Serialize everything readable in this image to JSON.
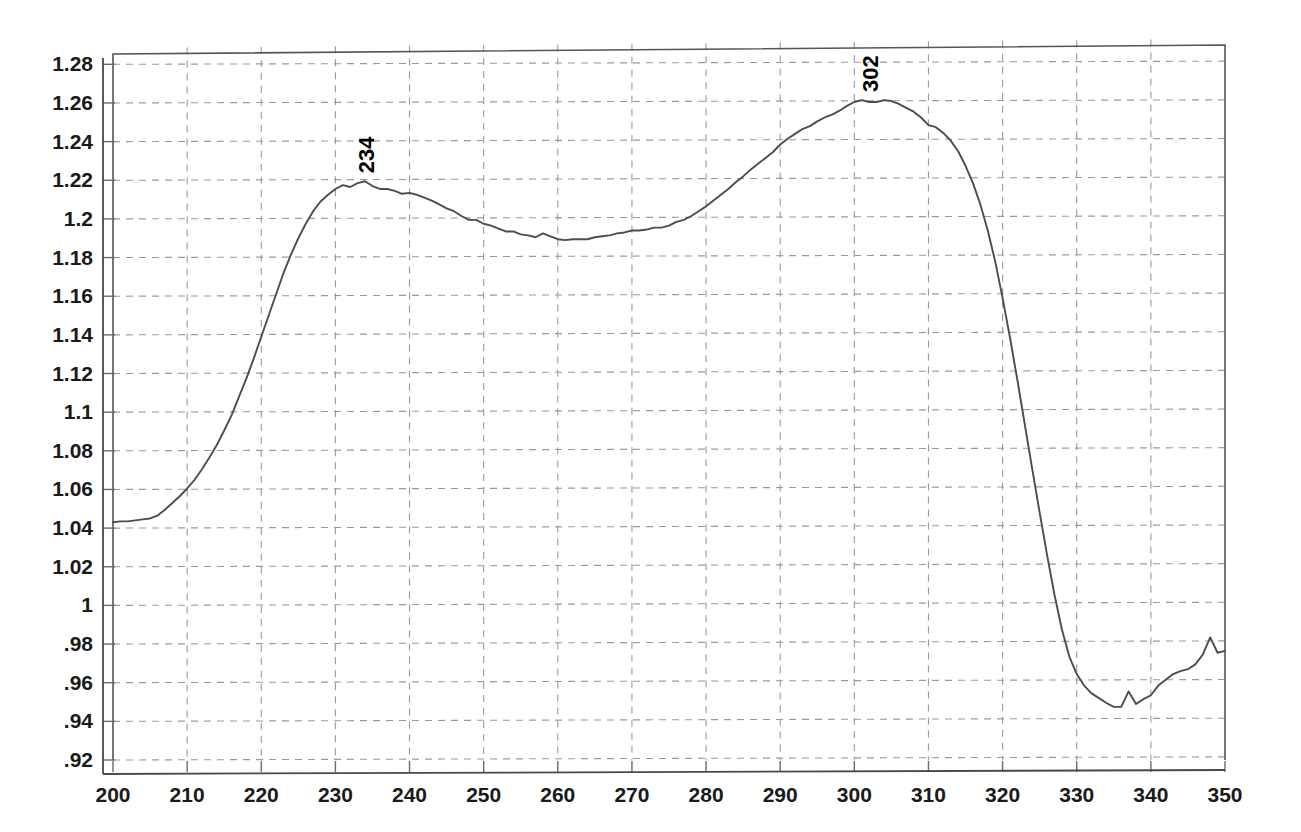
{
  "chart_data": {
    "type": "line",
    "title": "",
    "subtitle": "",
    "xlabel": "",
    "ylabel": "",
    "xlim": [
      200,
      350
    ],
    "ylim": [
      0.92,
      1.29
    ],
    "grid": true,
    "legend": "none",
    "x_ticks": [
      200,
      210,
      220,
      230,
      240,
      250,
      260,
      270,
      280,
      290,
      300,
      310,
      320,
      330,
      340,
      350
    ],
    "x_tick_labels": [
      "200",
      "210",
      "220",
      "230",
      "240",
      "250",
      "260",
      "270",
      "280",
      "290",
      "300",
      "310",
      "320",
      "330",
      "340",
      "350"
    ],
    "y_ticks": [
      0.92,
      0.94,
      0.96,
      0.98,
      1.0,
      1.02,
      1.04,
      1.06,
      1.08,
      1.1,
      1.12,
      1.14,
      1.16,
      1.18,
      1.2,
      1.22,
      1.24,
      1.26,
      1.28
    ],
    "y_tick_labels": [
      ".92",
      ".94",
      ".96",
      ".98",
      "1",
      "1.02",
      "1.04",
      "1.06",
      "1.08",
      "1.1",
      "1.12",
      "1.14",
      "1.16",
      "1.18",
      "1.2",
      "1.22",
      "1.24",
      "1.26",
      "1.28"
    ],
    "annotations": [
      {
        "label": "234",
        "x": 234,
        "y": 1.2195,
        "rotation": -90
      },
      {
        "label": "302",
        "x": 302,
        "y": 1.2615,
        "rotation": -90
      }
    ],
    "series": [
      {
        "name": "spectrum",
        "color": "#4d4d4d",
        "x": [
          200,
          201,
          202,
          203,
          204,
          205,
          206,
          207,
          208,
          209,
          210,
          211,
          212,
          213,
          214,
          215,
          216,
          217,
          218,
          219,
          220,
          221,
          222,
          223,
          224,
          225,
          226,
          227,
          228,
          229,
          230,
          231,
          232,
          233,
          234,
          235,
          236,
          237,
          238,
          239,
          240,
          241,
          242,
          243,
          244,
          245,
          246,
          247,
          248,
          249,
          250,
          251,
          252,
          253,
          254,
          255,
          256,
          257,
          258,
          259,
          260,
          261,
          262,
          263,
          264,
          265,
          266,
          267,
          268,
          269,
          270,
          271,
          272,
          273,
          274,
          275,
          276,
          277,
          278,
          279,
          280,
          281,
          282,
          283,
          284,
          285,
          286,
          287,
          288,
          289,
          290,
          291,
          292,
          293,
          294,
          295,
          296,
          297,
          298,
          299,
          300,
          301,
          302,
          303,
          304,
          305,
          306,
          307,
          308,
          309,
          310,
          311,
          312,
          313,
          314,
          315,
          316,
          317,
          318,
          319,
          320,
          321,
          322,
          323,
          324,
          325,
          326,
          327,
          328,
          329,
          330,
          331,
          332,
          333,
          334,
          335,
          336,
          337,
          338,
          339,
          340,
          341,
          342,
          343,
          344,
          345,
          346,
          347,
          348,
          349,
          350
        ],
        "y": [
          1.043,
          1.0435,
          1.0435,
          1.044,
          1.0445,
          1.045,
          1.0465,
          1.0495,
          1.053,
          1.0565,
          1.0605,
          1.065,
          1.0705,
          1.0765,
          1.083,
          1.0905,
          1.0985,
          1.108,
          1.1175,
          1.128,
          1.139,
          1.15,
          1.161,
          1.172,
          1.1815,
          1.19,
          1.1975,
          1.204,
          1.209,
          1.2125,
          1.2155,
          1.2175,
          1.2165,
          1.2185,
          1.2195,
          1.217,
          1.2155,
          1.2155,
          1.2145,
          1.213,
          1.2135,
          1.2125,
          1.211,
          1.2095,
          1.2075,
          1.2055,
          1.204,
          1.2015,
          1.1995,
          1.1995,
          1.1975,
          1.1965,
          1.195,
          1.1935,
          1.1935,
          1.192,
          1.1915,
          1.1905,
          1.1925,
          1.191,
          1.1895,
          1.189,
          1.1895,
          1.1895,
          1.1895,
          1.1905,
          1.191,
          1.1915,
          1.1925,
          1.193,
          1.194,
          1.194,
          1.1945,
          1.1955,
          1.1955,
          1.1965,
          1.1985,
          1.1995,
          1.2015,
          1.204,
          1.2065,
          1.2095,
          1.2125,
          1.2155,
          1.219,
          1.222,
          1.2255,
          1.2285,
          1.2315,
          1.2345,
          1.2385,
          1.2415,
          1.244,
          1.2465,
          1.248,
          1.2505,
          1.2525,
          1.254,
          1.256,
          1.2585,
          1.2605,
          1.2615,
          1.2605,
          1.2605,
          1.2615,
          1.261,
          1.2595,
          1.2575,
          1.2555,
          1.2525,
          1.2485,
          1.2475,
          1.2445,
          1.2405,
          1.235,
          1.2275,
          1.2185,
          1.2075,
          1.194,
          1.178,
          1.159,
          1.1385,
          1.1165,
          1.0935,
          1.0705,
          1.048,
          1.026,
          1.0055,
          0.9875,
          0.9735,
          0.9645,
          0.9585,
          0.9545,
          0.952,
          0.9495,
          0.9475,
          0.9475,
          0.9555,
          0.949,
          0.9515,
          0.9535,
          0.9585,
          0.9615,
          0.9645,
          0.966,
          0.967,
          0.9695,
          0.9745,
          0.9835,
          0.9755,
          0.9765
        ]
      }
    ]
  }
}
